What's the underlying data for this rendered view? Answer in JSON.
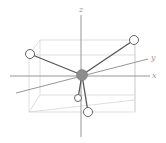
{
  "diagram": {
    "title": "",
    "type": "molecular-geometry-3d",
    "axes": {
      "x_label": "x",
      "y_label": "y",
      "z_label": "z"
    },
    "central_atom": {
      "x": 82,
      "y": 75,
      "r": 5.5,
      "fill": "#8c8c8c"
    },
    "ligands": [
      {
        "name": "ligand-top-left",
        "x": 30,
        "y": 54,
        "r": 4.5
      },
      {
        "name": "ligand-top-right",
        "x": 134,
        "y": 40,
        "r": 4.5
      },
      {
        "name": "ligand-bottom-small",
        "x": 78,
        "y": 98,
        "r": 3.5
      },
      {
        "name": "ligand-bottom",
        "x": 88,
        "y": 112,
        "r": 4.5
      }
    ],
    "colors": {
      "axis": "#8a8a8a",
      "cube": "#d6d6d6",
      "bond": "#555555",
      "ligand_fill": "#ffffff",
      "ligand_stroke": "#666666"
    }
  }
}
